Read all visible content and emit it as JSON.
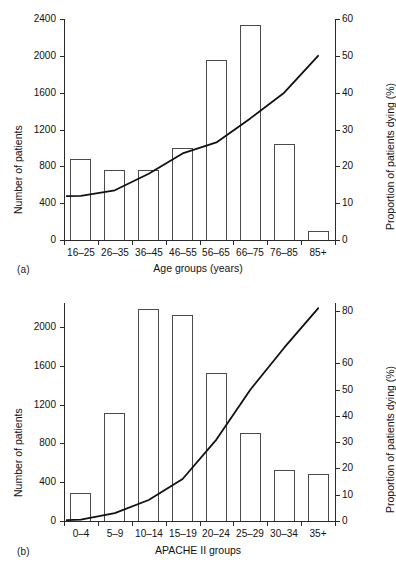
{
  "figure": {
    "panels": [
      {
        "tag": "(a)",
        "xlabel": "Age groups (years)",
        "ylabel_left": "Number of patients",
        "ylabel_right": "Proportion of patients dying (%)"
      },
      {
        "tag": "(b)",
        "xlabel": "APACHE II groups",
        "ylabel_left": "Number of patients",
        "ylabel_right": "Proportion of patients dying (%)"
      }
    ]
  },
  "chart_data": [
    {
      "type": "bar",
      "panel": "(a)",
      "title": "",
      "xlabel": "Age groups (years)",
      "ylabel": "Number of patients",
      "ylabel_secondary": "Proportion of patients dying (%)",
      "categories": [
        "16–25",
        "26–35",
        "36–45",
        "46–55",
        "56–65",
        "66–75",
        "76–85",
        "85+"
      ],
      "series": [
        {
          "name": "Number of patients",
          "axis": "left",
          "type": "bar",
          "values": [
            880,
            760,
            765,
            1000,
            1950,
            2340,
            1040,
            100
          ]
        },
        {
          "name": "Proportion of patients dying (%)",
          "axis": "right",
          "type": "line",
          "values": [
            12,
            13.5,
            18,
            23.5,
            26.5,
            33,
            40,
            50
          ]
        }
      ],
      "ylim": [
        0,
        2400
      ],
      "yticks": [
        0,
        400,
        800,
        1200,
        1600,
        2000,
        2400
      ],
      "ylim_secondary": [
        0,
        60
      ],
      "yticks_secondary": [
        0,
        10,
        20,
        30,
        40,
        50,
        60
      ],
      "grid": false,
      "legend": "none"
    },
    {
      "type": "bar",
      "panel": "(b)",
      "title": "",
      "xlabel": "APACHE II groups",
      "ylabel": "Number of patients",
      "ylabel_secondary": "Proportion of patients dying (%)",
      "categories": [
        "0–4",
        "5–9",
        "10–14",
        "15–19",
        "20–24",
        "25–29",
        "30–34",
        "35+"
      ],
      "series": [
        {
          "name": "Number of patients",
          "axis": "left",
          "type": "bar",
          "values": [
            290,
            1110,
            2190,
            2130,
            1530,
            910,
            530,
            480
          ]
        },
        {
          "name": "Proportion of patients dying (%)",
          "axis": "right",
          "type": "line",
          "values": [
            0.5,
            3,
            8,
            16,
            31,
            50,
            66,
            81
          ]
        }
      ],
      "ylim": [
        0,
        2250
      ],
      "yticks": [
        0,
        400,
        800,
        1200,
        1600,
        2000
      ],
      "ylim_secondary": [
        0,
        83
      ],
      "yticks_secondary": [
        0,
        10,
        20,
        30,
        40,
        50,
        60,
        80
      ],
      "grid": false,
      "legend": "none"
    }
  ]
}
